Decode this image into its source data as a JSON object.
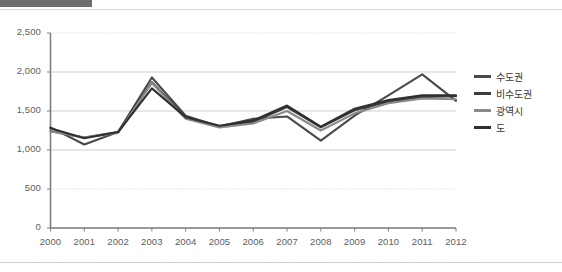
{
  "page": {
    "background_color": "#ffffff",
    "top_strip_color": "#6e6e6e",
    "rule_color": "#d8d8d8"
  },
  "chart_data": {
    "type": "line",
    "title": "",
    "subtitle": "",
    "xlabel": "",
    "ylabel": "",
    "categories": [
      "2000",
      "2001",
      "2002",
      "2003",
      "2004",
      "2005",
      "2006",
      "2007",
      "2008",
      "2009",
      "2010",
      "2011",
      "2012"
    ],
    "x": [
      2000,
      2001,
      2002,
      2003,
      2004,
      2005,
      2006,
      2007,
      2008,
      2009,
      2010,
      2011,
      2012
    ],
    "ylim": [
      0,
      2500
    ],
    "ytick_values": [
      0,
      500,
      1000,
      1500,
      2000,
      2500
    ],
    "ytick_labels": [
      "0",
      "500",
      "1,000",
      "1,500",
      "2,000",
      "2,500"
    ],
    "grid": true,
    "grid_axis": "y",
    "grid_color": "#c9c9c9",
    "axis_color": "#808080",
    "legend_position": "right",
    "series": [
      {
        "name": "수도권",
        "color": "#4a4a4a",
        "width": 2.1,
        "values": [
          1290,
          1070,
          1230,
          1930,
          1440,
          1300,
          1400,
          1430,
          1120,
          1440,
          1700,
          1970,
          1630
        ]
      },
      {
        "name": "비수도권",
        "color": "#3d3d3d",
        "width": 2.1,
        "values": [
          1240,
          1160,
          1230,
          1870,
          1420,
          1300,
          1360,
          1550,
          1290,
          1510,
          1620,
          1680,
          1690
        ]
      },
      {
        "name": "광역시",
        "color": "#8a8a8a",
        "width": 2.1,
        "values": [
          1240,
          1160,
          1220,
          1860,
          1400,
          1290,
          1340,
          1500,
          1250,
          1470,
          1600,
          1660,
          1650
        ]
      },
      {
        "name": "도",
        "color": "#2f2f2f",
        "width": 2.1,
        "values": [
          1280,
          1150,
          1230,
          1790,
          1420,
          1310,
          1380,
          1570,
          1300,
          1530,
          1640,
          1700,
          1700
        ]
      }
    ]
  },
  "legend": {
    "items": [
      {
        "label": "수도권",
        "color": "#4a4a4a"
      },
      {
        "label": "비수도권",
        "color": "#3d3d3d"
      },
      {
        "label": "광역시",
        "color": "#8a8a8a"
      },
      {
        "label": "도",
        "color": "#2f2f2f"
      }
    ]
  }
}
